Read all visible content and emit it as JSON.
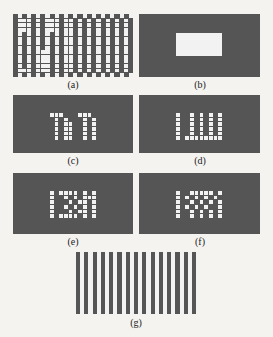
{
  "captions": {
    "a": "(a)",
    "b": "(b)",
    "c": "(c)",
    "d": "(d)",
    "e": "(e)",
    "f": "(f)",
    "g": "(g)"
  },
  "colors": {
    "dark": "#555555",
    "light": "#f2f2f2",
    "background": "#f4f3f0"
  },
  "panels": {
    "a": {
      "description": "Full binary mask pattern grid (left half interleaved, right half checkerboard/striped)",
      "cols": 26,
      "rows": 14,
      "pattern": [
        "01010101010101010101010101",
        "01110101110110101010101010",
        "01110101110110101010101010",
        "01110101110110101010101010",
        "01010101010110101010101010",
        "01010101010110101010101010",
        "01010101010110101010101010",
        "01010101010110101010101010",
        "01010111010110101010101010",
        "01010111010110101010101010",
        "01010111010110101010101010",
        "01010111010110101010101010",
        "01110111010110101010101010",
        "01010101010101010101010101"
      ]
    },
    "b": {
      "description": "Dark field with a single light rectangular window"
    },
    "c": {
      "description": "Small dot pattern subset",
      "cols": 10,
      "rows": 6,
      "pattern": [
        "1110001110",
        "0101000101",
        "0101100101",
        "0101100101",
        "0101100101",
        "0101100101"
      ]
    },
    "d": {
      "description": "Small dot pattern subset",
      "cols": 10,
      "rows": 6,
      "pattern": [
        "1001010101",
        "1001010101",
        "1001010101",
        "1001010101",
        "1001010101",
        "1011111111"
      ]
    },
    "e": {
      "description": "Small dot pattern subset",
      "cols": 10,
      "rows": 6,
      "pattern": [
        "1011110101",
        "1001010111",
        "1000101101",
        "1001010101",
        "1000101101",
        "1011110101"
      ]
    },
    "f": {
      "description": "Small dot pattern subset",
      "cols": 10,
      "rows": 6,
      "pattern": [
        "1001111101",
        "1010101010",
        "1001010101",
        "1010101001",
        "1001010101",
        "1001010101"
      ]
    },
    "g": {
      "description": "Vertical stripes alternating dark and light",
      "stripe_count": 29
    }
  }
}
